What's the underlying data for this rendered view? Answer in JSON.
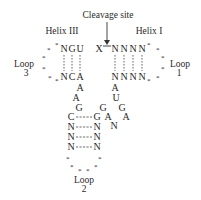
{
  "labels": {
    "cleavage_site": "Cleavage site",
    "helix_3": "Helix III",
    "helix_1": "Helix I",
    "loop_3": "Loop",
    "loop_3_num": "3",
    "loop_1": "Loop",
    "loop_1_num": "1",
    "loop_2": "Loop",
    "loop_2_num": "2"
  },
  "helix_3": {
    "top": [
      "N",
      "G",
      "U"
    ],
    "bottom": [
      "N",
      "C",
      "A"
    ]
  },
  "cleavage_nt": "X",
  "helix_1": {
    "top": [
      "N",
      "N",
      "N",
      "N"
    ],
    "bottom": [
      "N",
      "N",
      "N",
      "N"
    ]
  },
  "left_strand": [
    "A",
    "A",
    "G"
  ],
  "right_strand": [
    "A",
    "U",
    "G",
    "A",
    "G",
    "A",
    "G",
    "N"
  ],
  "helix_2": {
    "left": [
      "C",
      "N",
      "N",
      "N"
    ],
    "right": [
      "G",
      "N",
      "N",
      "N"
    ]
  },
  "loop_marker": "*",
  "colors": {
    "text": "#2a2a2a",
    "line": "#444444",
    "background": "#ffffff"
  }
}
